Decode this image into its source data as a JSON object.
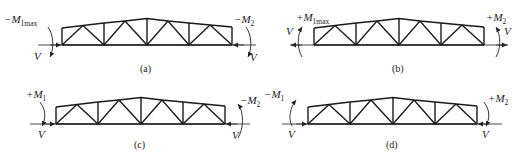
{
  "figure": {
    "panels": [
      {
        "id": "a",
        "caption": "(a)",
        "left_moment": {
          "sign": "−",
          "symbol": "M",
          "subscript": "1max"
        },
        "right_moment": {
          "sign": "−",
          "symbol": "M",
          "subscript": "2"
        },
        "left_shear": "V",
        "right_shear": "V"
      },
      {
        "id": "b",
        "caption": "(b)",
        "left_moment": {
          "sign": "+",
          "symbol": "M",
          "subscript": "1max"
        },
        "right_moment": {
          "sign": "+",
          "symbol": "M",
          "subscript": "2"
        },
        "left_shear": "V",
        "right_shear": "V"
      },
      {
        "id": "c",
        "caption": "(c)",
        "left_moment": {
          "sign": "+",
          "symbol": "M",
          "subscript": "1"
        },
        "right_moment": {
          "sign": "−",
          "symbol": "M",
          "subscript": "2"
        },
        "left_shear": "V",
        "right_shear": "V"
      },
      {
        "id": "d",
        "caption": "(d)",
        "left_moment": {
          "sign": "−",
          "symbol": "M",
          "subscript": "1"
        },
        "right_moment": {
          "sign": "+",
          "symbol": "M",
          "subscript": "2"
        },
        "left_shear": "V",
        "right_shear": "V"
      }
    ],
    "colors": {
      "line": "#1a1a1a",
      "text": "#222222",
      "background": "#ffffff"
    }
  }
}
